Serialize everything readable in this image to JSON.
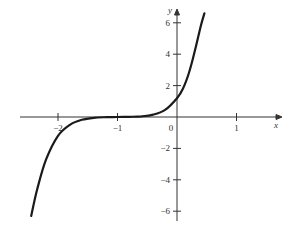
{
  "chart_data": {
    "type": "line",
    "title": "",
    "xlabel": "x",
    "ylabel": "y",
    "xlim": [
      -2.6,
      1.7
    ],
    "ylim": [
      -6.5,
      7
    ],
    "x_ticks": [
      -2,
      -1,
      0,
      1
    ],
    "x_tick_labels": [
      "−2",
      "−1",
      "0",
      "1"
    ],
    "y_ticks": [
      -6,
      -4,
      -2,
      2,
      4,
      6
    ],
    "y_tick_labels": [
      "−6",
      "−4",
      "−2",
      "2",
      "4",
      "6"
    ],
    "grid": false,
    "legend": null,
    "series": [
      {
        "name": "curve",
        "x": [
          -2.45,
          -2.35,
          -2.2,
          -2.0,
          -1.8,
          -1.6,
          -1.4,
          -1.2,
          -1.0,
          -0.8,
          -0.6,
          -0.4,
          -0.2,
          0.0,
          0.1,
          0.2,
          0.3,
          0.4,
          0.46
        ],
        "y": [
          -6.3,
          -4.6,
          -2.7,
          -1.2,
          -0.5,
          -0.18,
          -0.05,
          -0.01,
          0.0,
          0.01,
          0.04,
          0.15,
          0.45,
          1.2,
          1.8,
          2.8,
          4.2,
          5.8,
          6.6
        ]
      }
    ],
    "color": "#1a1a1a"
  }
}
